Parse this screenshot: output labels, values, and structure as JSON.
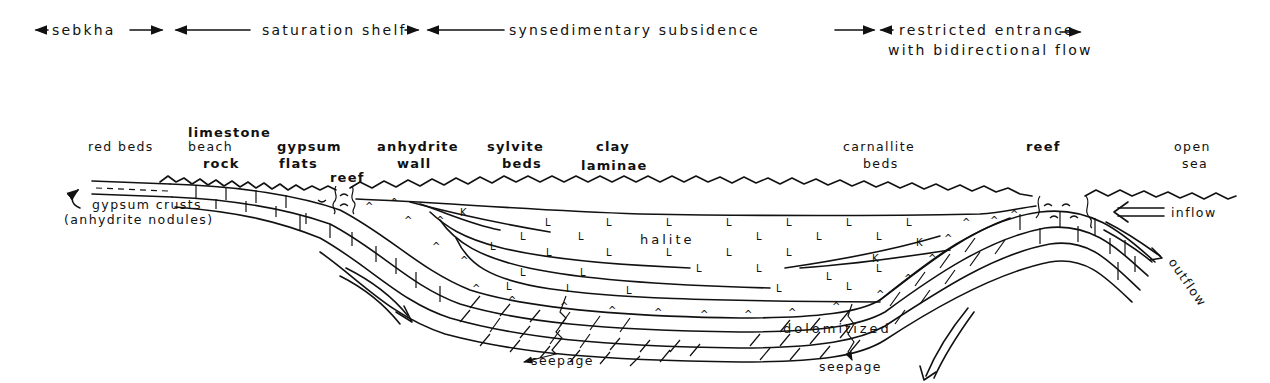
{
  "zones": [
    {
      "id": "sebkha",
      "label": "sebkha"
    },
    {
      "id": "saturation-shelf",
      "label": "saturation shelf"
    },
    {
      "id": "synsedimentary-subsidence",
      "label": "synsedimentary subsidence"
    },
    {
      "id": "restricted-entrance",
      "label": "restricted entrance",
      "label2": "with bidirectional flow"
    }
  ],
  "facies_labels": {
    "red_beds": "red beds",
    "limestone": "limestone",
    "beach": "beach",
    "rock": "rock",
    "gypsum": "gypsum",
    "flats": "flats",
    "reef_left": "reef",
    "anhydrite": "anhydrite",
    "wall": "wall",
    "sylvite": "sylvite",
    "beds_sylvite": "beds",
    "clay": "clay",
    "laminae": "laminae",
    "carnallite": "carnallite",
    "beds_carnallite": "beds",
    "reef_right": "reef",
    "open": "open",
    "sea": "sea"
  },
  "annotations": {
    "gypsum_crusts": "gypsum crusts",
    "anhydrite_nodules": "(anhydrite nodules)",
    "halite": "halite",
    "dolomitized": "dolomitized",
    "seepage_left": "seepage",
    "seepage_right": "seepage",
    "inflow": "inflow",
    "outflow": "outflow"
  },
  "symbols": {
    "halite": "L",
    "anhydrite": "^",
    "potash": "K",
    "reef": "⌒"
  }
}
